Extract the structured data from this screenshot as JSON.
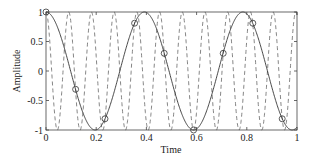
{
  "chart_data": {
    "type": "line",
    "title": "",
    "xlabel": "Time",
    "ylabel": "Amplitude",
    "xlim": [
      0,
      1
    ],
    "ylim": [
      -1,
      1
    ],
    "grid": false,
    "legend": null,
    "xticks": [
      "0",
      "0.2",
      "0.4",
      "0.6",
      "0.8",
      "1"
    ],
    "yticks": [
      "-1",
      "-0.5",
      "0",
      "0.5",
      "1"
    ],
    "series": [
      {
        "name": "high-frequency signal (dashed)",
        "style": "dashed",
        "function": "cos(2*pi*11.05*t)",
        "frequency": 11.05
      },
      {
        "name": "aliased low-frequency signal (solid)",
        "style": "solid",
        "function": "cos(2*pi*2.55*t)",
        "frequency": 2.55
      },
      {
        "name": "samples (circles)",
        "style": "markers-circle",
        "x": [
          0,
          0.118,
          0.235,
          0.353,
          0.471,
          0.588,
          0.706,
          0.824,
          0.941
        ],
        "y": [
          1.0,
          -0.31,
          -0.81,
          0.81,
          0.3,
          -1.0,
          0.3,
          0.81,
          -0.81
        ]
      }
    ]
  },
  "axes": {
    "xlabel": "Time",
    "ylabel": "Amplitude",
    "xticks": [
      "0",
      "0.2",
      "0.4",
      "0.6",
      "0.8",
      "1"
    ],
    "yticks": [
      "1",
      "0.5",
      "0",
      "-0.5",
      "-1"
    ]
  }
}
